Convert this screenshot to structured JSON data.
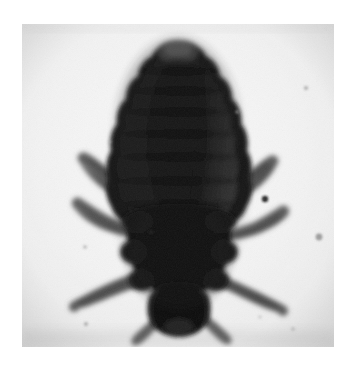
{
  "page": {
    "width": 356,
    "height": 374,
    "background_color": "#ffffff"
  },
  "photo": {
    "frame": {
      "x": 22,
      "y": 24,
      "width": 312,
      "height": 323
    },
    "background_color": "#eeeeee",
    "background_color_light": "#f4f4f4",
    "background_color_shadow": "#d9d9d9",
    "grain": "film-grain-texture",
    "caption": ""
  },
  "specimen": {
    "name": "head-louse",
    "orientation": "abdomen-up-head-down",
    "body_color_dark": "#141414",
    "body_color_mid": "#2d2d2d",
    "body_color_edge": "#3c3c3c",
    "leg_color": "#5e5e5e",
    "leg_color_dark": "#3f3f3f",
    "parts": [
      {
        "id": "abdomen",
        "label": "Abdomen",
        "segments": 7
      },
      {
        "id": "thorax",
        "label": "Thorax",
        "segments": 1
      },
      {
        "id": "head",
        "label": "Head",
        "segments": 1
      },
      {
        "id": "antennae",
        "label": "Antennae",
        "count": 2
      },
      {
        "id": "legs",
        "label": "Legs",
        "count": 6
      }
    ],
    "legs": [
      {
        "id": "leg-left-front",
        "side": "left",
        "row": 1
      },
      {
        "id": "leg-left-middle",
        "side": "left",
        "row": 2
      },
      {
        "id": "leg-left-hind",
        "side": "left",
        "row": 3
      },
      {
        "id": "leg-right-front",
        "side": "right",
        "row": 1
      },
      {
        "id": "leg-right-middle",
        "side": "right",
        "row": 2
      },
      {
        "id": "leg-right-hind",
        "side": "right",
        "row": 3
      }
    ],
    "specks": [
      {
        "id": "speck-1",
        "x": 243,
        "y": 175,
        "r": 3.2
      },
      {
        "id": "speck-2",
        "x": 129,
        "y": 208,
        "r": 2.6
      },
      {
        "id": "speck-3",
        "x": 297,
        "y": 213,
        "r": 3.4
      },
      {
        "id": "speck-4",
        "x": 284,
        "y": 64,
        "r": 2.2
      },
      {
        "id": "speck-5",
        "x": 129,
        "y": 265,
        "r": 2.4
      },
      {
        "id": "speck-6",
        "x": 64,
        "y": 300,
        "r": 2.2
      },
      {
        "id": "speck-7",
        "x": 63,
        "y": 223,
        "r": 2.0
      },
      {
        "id": "speck-8",
        "x": 271,
        "y": 305,
        "r": 2.0
      },
      {
        "id": "speck-9",
        "x": 215,
        "y": 88,
        "r": 2.0
      }
    ]
  }
}
